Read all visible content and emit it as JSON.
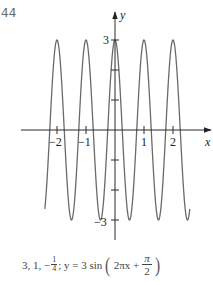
{
  "problem_number": "44",
  "chart_data": {
    "type": "line",
    "title": "",
    "function": "y = 3 sin(2πx + π/2)",
    "amplitude": 3,
    "period": 1,
    "phase_shift": -0.25,
    "xlabel": "x",
    "ylabel": "y",
    "x_ticks": [
      -2,
      -1,
      1,
      2
    ],
    "x_tick_labels": [
      "−2",
      "−1",
      "1",
      "2"
    ],
    "y_ticks": [
      -3,
      -2,
      -1,
      1,
      2,
      3
    ],
    "y_tick_labels": [
      "−3",
      "3"
    ],
    "xlim": [
      -2.42,
      2.58
    ],
    "ylim": [
      -3,
      3
    ],
    "grid": false,
    "series": [
      {
        "name": "y = 3 sin(2πx + π/2)",
        "x": [
          -2.5,
          -2,
          -1.5,
          -1,
          -0.5,
          0,
          0.5,
          1,
          1.5,
          2,
          2.5
        ],
        "values": [
          -3,
          3,
          -3,
          3,
          -3,
          3,
          -3,
          3,
          -3,
          3,
          -3
        ]
      }
    ]
  },
  "axes": {
    "x_label": "x",
    "y_label": "y",
    "x_tick_labels": [
      "−2",
      "−1",
      "1",
      "2"
    ],
    "y_top_label": "3",
    "y_bottom_label": "−3"
  },
  "caption": {
    "values": "3, 1, −",
    "frac_num": "1",
    "frac_den": "4",
    "equation_start": "; y = 3 sin",
    "inner": "2πx +",
    "pi_num": "π",
    "pi_den": "2"
  }
}
